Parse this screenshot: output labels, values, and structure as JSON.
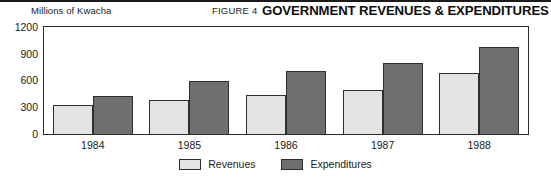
{
  "figure": {
    "number_label": "FIGURE 4",
    "title": "GOVERNMENT REVENUES & EXPENDITURES",
    "unit_label": "Millions of Kwacha"
  },
  "legend": {
    "items": [
      {
        "label": "Revenues",
        "swatch": "revenues",
        "color": "#e3e3e3"
      },
      {
        "label": "Expenditures",
        "swatch": "expenditures",
        "color": "#6f6f6f"
      }
    ]
  },
  "axis": {
    "y_ticks": [
      "1200",
      "900",
      "600",
      "300",
      "0"
    ]
  },
  "chart_data": {
    "type": "bar",
    "title": "GOVERNMENT REVENUES & EXPENDITURES",
    "subtitle": "FIGURE 4",
    "xlabel": "",
    "ylabel": "Millions of Kwacha",
    "ylim": [
      0,
      1200
    ],
    "yticks": [
      0,
      300,
      600,
      900,
      1200
    ],
    "grid": false,
    "legend_position": "bottom-center",
    "categories": [
      "1984",
      "1985",
      "1986",
      "1987",
      "1988"
    ],
    "series": [
      {
        "name": "Revenues",
        "color": "#e3e3e3",
        "values": [
          325,
          380,
          435,
          500,
          690
        ]
      },
      {
        "name": "Expenditures",
        "color": "#6f6f6f",
        "values": [
          425,
          600,
          710,
          800,
          980
        ]
      }
    ]
  }
}
